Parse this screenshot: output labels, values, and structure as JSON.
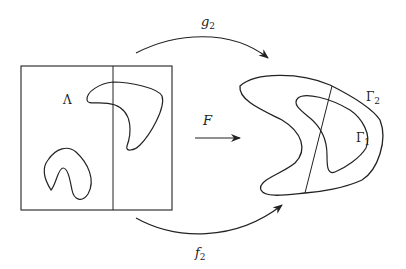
{
  "diagram": {
    "labels": {
      "lambda": "Λ",
      "F": "F",
      "g": "g",
      "g_sub": "2",
      "f": "f",
      "f_sub": "2",
      "gamma1": "Γ",
      "gamma1_sub": "1",
      "gamma2": "Γ",
      "gamma2_sub": "2"
    },
    "colors": {
      "stroke": "#222222",
      "background": "#ffffff"
    }
  }
}
